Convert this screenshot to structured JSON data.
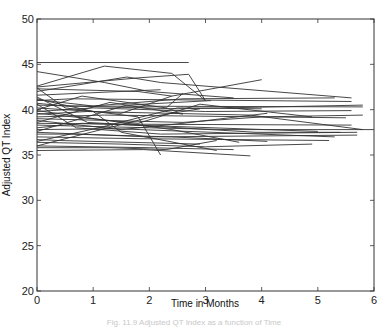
{
  "chart_data": {
    "type": "line",
    "title": "",
    "xlabel": "Time in Months",
    "ylabel": "Adjusted QT Index",
    "xlim": [
      0,
      6
    ],
    "ylim": [
      20,
      50
    ],
    "xticks": [
      0,
      1,
      2,
      3,
      4,
      5,
      6
    ],
    "yticks": [
      20,
      25,
      30,
      35,
      40,
      45,
      50
    ],
    "grid": false,
    "legend": null,
    "line_color": "#333333",
    "series": [
      {
        "name": "s1",
        "x": [
          0,
          2.7
        ],
        "y": [
          45.2,
          45.2
        ]
      },
      {
        "name": "s2",
        "x": [
          0,
          1.2,
          2.0,
          3.5
        ],
        "y": [
          44.2,
          43.0,
          42.0,
          41.3
        ]
      },
      {
        "name": "s3",
        "x": [
          0,
          1.2,
          2.4,
          3.0
        ],
        "y": [
          42.6,
          44.8,
          44.0,
          41.0
        ]
      },
      {
        "name": "s4",
        "x": [
          0,
          1.8,
          2.7,
          3.0
        ],
        "y": [
          42.5,
          43.5,
          43.9,
          41.0
        ]
      },
      {
        "name": "s5",
        "x": [
          0,
          1.6,
          2.2,
          5.6
        ],
        "y": [
          42.0,
          43.6,
          43.0,
          41.3
        ]
      },
      {
        "name": "s6",
        "x": [
          0,
          1.8,
          2.4,
          4.0
        ],
        "y": [
          42.3,
          42.0,
          41.5,
          43.3
        ]
      },
      {
        "name": "s7",
        "x": [
          0,
          2.2
        ],
        "y": [
          41.6,
          42.2
        ]
      },
      {
        "name": "s8",
        "x": [
          0,
          1.0,
          2.6,
          5.3
        ],
        "y": [
          41.1,
          40.4,
          41.2,
          41.3
        ]
      },
      {
        "name": "s9",
        "x": [
          0,
          0.6,
          5.6
        ],
        "y": [
          41.0,
          41.2,
          40.9
        ]
      },
      {
        "name": "s10",
        "x": [
          0,
          0.5,
          5.8
        ],
        "y": [
          40.7,
          40.4,
          40.3
        ]
      },
      {
        "name": "s11",
        "x": [
          0,
          2.5,
          5.8
        ],
        "y": [
          40.5,
          40.1,
          40.5
        ]
      },
      {
        "name": "s12",
        "x": [
          0,
          1.5,
          2.4
        ],
        "y": [
          40.2,
          39.6,
          41.5
        ]
      },
      {
        "name": "s13",
        "x": [
          0,
          0.8,
          2.3,
          2.6
        ],
        "y": [
          40.0,
          41.5,
          40.2,
          41.8
        ]
      },
      {
        "name": "s14",
        "x": [
          0,
          1.0,
          3.0,
          5.6
        ],
        "y": [
          39.8,
          40.2,
          39.8,
          39.9
        ]
      },
      {
        "name": "s15",
        "x": [
          0,
          1.8,
          2.9,
          4.9
        ],
        "y": [
          39.6,
          38.5,
          40.6,
          39.2
        ]
      },
      {
        "name": "s16",
        "x": [
          0,
          0.9,
          3.8,
          5.8
        ],
        "y": [
          39.5,
          39.8,
          39.4,
          37.8
        ]
      },
      {
        "name": "s17",
        "x": [
          0,
          1.2,
          5.5
        ],
        "y": [
          39.2,
          39.4,
          39.1
        ]
      },
      {
        "name": "s18",
        "x": [
          0,
          2.6,
          4.0,
          5.8
        ],
        "y": [
          39.0,
          38.6,
          39.2,
          39.4
        ]
      },
      {
        "name": "s19",
        "x": [
          0,
          1.5,
          2.6,
          4.1
        ],
        "y": [
          38.8,
          37.8,
          38.5,
          39.6
        ]
      },
      {
        "name": "s20",
        "x": [
          0,
          1.6,
          5.6
        ],
        "y": [
          38.5,
          38.4,
          38.3
        ]
      },
      {
        "name": "s21",
        "x": [
          0,
          2.0,
          3.4,
          6.0
        ],
        "y": [
          38.3,
          38.0,
          37.8,
          37.8
        ]
      },
      {
        "name": "s22",
        "x": [
          0,
          0.8,
          5.0
        ],
        "y": [
          38.0,
          38.5,
          37.6
        ]
      },
      {
        "name": "s23",
        "x": [
          0,
          1.4,
          5.3
        ],
        "y": [
          37.8,
          37.9,
          37.0
        ]
      },
      {
        "name": "s24",
        "x": [
          0,
          2.0,
          5.7
        ],
        "y": [
          37.5,
          37.0,
          37.2
        ]
      },
      {
        "name": "s25",
        "x": [
          0,
          0.6,
          2.4,
          4.1
        ],
        "y": [
          37.3,
          37.3,
          37.0,
          36.5
        ]
      },
      {
        "name": "s26",
        "x": [
          0,
          1.8,
          5.2
        ],
        "y": [
          37.0,
          36.8,
          36.6
        ]
      },
      {
        "name": "s27",
        "x": [
          0,
          0.4,
          2.9
        ],
        "y": [
          36.7,
          36.6,
          36.2
        ]
      },
      {
        "name": "s28",
        "x": [
          0,
          1.5,
          3.0,
          4.9
        ],
        "y": [
          36.4,
          36.2,
          35.9,
          36.2
        ]
      },
      {
        "name": "s29",
        "x": [
          0,
          2.0,
          3.5
        ],
        "y": [
          36.0,
          35.8,
          35.6
        ]
      },
      {
        "name": "s30",
        "x": [
          0,
          1.3,
          2.3,
          3.2
        ],
        "y": [
          35.8,
          35.8,
          35.6,
          36.6
        ]
      },
      {
        "name": "s31",
        "x": [
          0,
          1.9,
          3.8
        ],
        "y": [
          35.5,
          35.6,
          34.9
        ]
      },
      {
        "name": "s32",
        "x": [
          0,
          0.5,
          1.8,
          2.2
        ],
        "y": [
          42.4,
          40.2,
          39.2,
          35.0
        ]
      },
      {
        "name": "s33",
        "x": [
          0,
          1.0,
          1.5,
          3.2
        ],
        "y": [
          41.2,
          39.8,
          37.5,
          35.5
        ]
      },
      {
        "name": "s34",
        "x": [
          0,
          0.7,
          2.2,
          5.7
        ],
        "y": [
          40.6,
          38.0,
          37.3,
          37.5
        ]
      },
      {
        "name": "s35",
        "x": [
          0,
          1.6,
          3.1
        ],
        "y": [
          37.6,
          40.5,
          41.0
        ]
      },
      {
        "name": "s36",
        "x": [
          0,
          1.1,
          2.5,
          4.0
        ],
        "y": [
          36.5,
          38.0,
          40.2,
          40.1
        ]
      },
      {
        "name": "s37",
        "x": [
          0,
          2.1,
          2.9
        ],
        "y": [
          36.0,
          39.3,
          40.1
        ]
      },
      {
        "name": "s38",
        "x": [
          0,
          1.3,
          2.6
        ],
        "y": [
          38.6,
          40.8,
          39.5
        ]
      },
      {
        "name": "s39",
        "x": [
          0,
          2.4,
          3.6
        ],
        "y": [
          39.9,
          37.8,
          36.4
        ]
      },
      {
        "name": "s40",
        "x": [
          0,
          0.9,
          3.9,
          5.4
        ],
        "y": [
          41.4,
          38.6,
          37.5,
          37.5
        ]
      }
    ]
  },
  "axes": {
    "xlabel": "Time in Months",
    "ylabel": "Adjusted QT Index",
    "xtick_labels": [
      "0",
      "1",
      "2",
      "3",
      "4",
      "5",
      "6"
    ],
    "ytick_labels": [
      "20",
      "25",
      "30",
      "35",
      "40",
      "45",
      "50"
    ]
  },
  "caption": "Fig. 11.9 Adjusted QT Index as a function of Time"
}
